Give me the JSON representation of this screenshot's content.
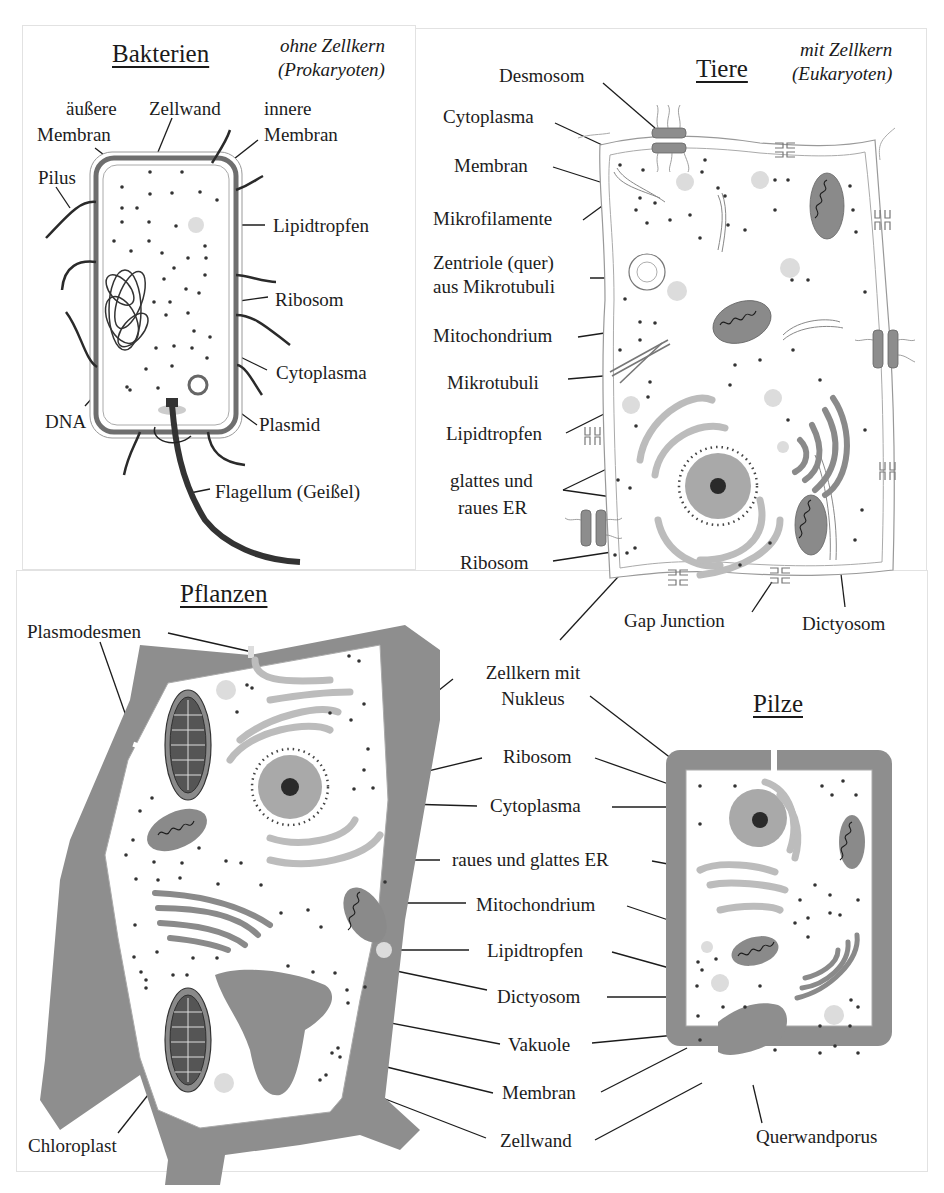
{
  "colors": {
    "wall": "#8c8c8c",
    "organelle_dark": "#8a8a8a",
    "organelle_light": "#bdbdbd",
    "lipid": "#d9d9d9",
    "ink": "#1c1c1c",
    "panel_border": "#e2e2e2"
  },
  "bacteria": {
    "title": "Bakterien",
    "note_line1": "ohne Zellkern",
    "note_line2": "(Prokaryoten)",
    "labels": {
      "outer_membrane_1": "äußere",
      "outer_membrane_2": "Membran",
      "cell_wall": "Zellwand",
      "inner_membrane_1": "innere",
      "inner_membrane_2": "Membran",
      "pilus": "Pilus",
      "lipid": "Lipidtropfen",
      "ribosome": "Ribosom",
      "cytoplasm": "Cytoplasma",
      "dna": "DNA",
      "plasmid": "Plasmid",
      "flagellum": "Flagellum (Geißel)"
    }
  },
  "animal": {
    "title": "Tiere",
    "note_line1": "mit Zellkern",
    "note_line2": "(Eukaryoten)",
    "labels": {
      "desmosome": "Desmosom",
      "cytoplasm": "Cytoplasma",
      "membrane": "Membran",
      "microfilaments": "Mikrofilamente",
      "centriole_1": "Zentriole (quer)",
      "centriole_2": "aus Mikrotubuli",
      "mitochondrion": "Mitochondrium",
      "microtubules": "Mikrotubuli",
      "lipid": "Lipidtropfen",
      "er_1": "glattes und",
      "er_2": "raues ER",
      "ribosome": "Ribosom",
      "gap_junction": "Gap Junction",
      "dictyosome": "Dictyosom"
    }
  },
  "plant": {
    "title": "Pflanzen",
    "labels": {
      "plasmodesmata": "Plasmodesmen",
      "chloroplast": "Chloroplast"
    }
  },
  "fungi": {
    "title": "Pilze",
    "labels": {
      "cross_wall_pore": "Querwandporus"
    }
  },
  "shared_labels": {
    "nucleus_1": "Zellkern mit",
    "nucleus_2": "Nukleus",
    "ribosome": "Ribosom",
    "cytoplasm": "Cytoplasma",
    "er": "raues und glattes ER",
    "mitochondrion": "Mitochondrium",
    "lipid": "Lipidtropfen",
    "dictyosome": "Dictyosom",
    "vacuole": "Vakuole",
    "membrane": "Membran",
    "cell_wall": "Zellwand"
  }
}
